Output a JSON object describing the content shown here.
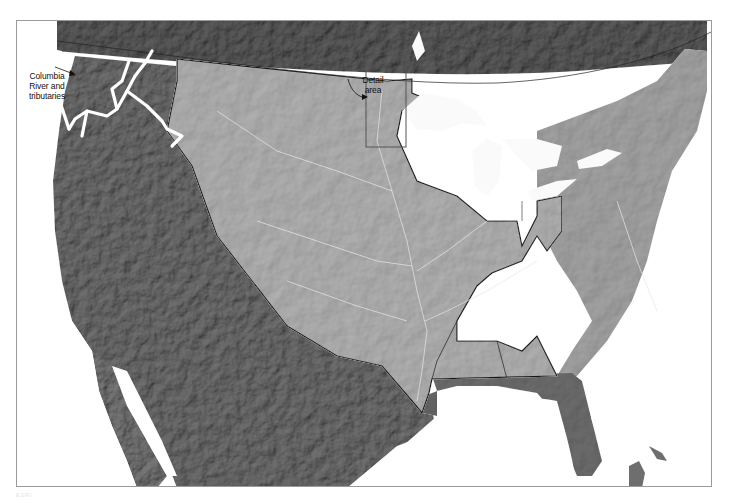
{
  "map": {
    "title": "Mississippi River basin shaded relief",
    "style": "grayscale shaded relief",
    "colors": {
      "background": "#ffffff",
      "water": "#ffffff",
      "basin_fill": "#b4b4b4",
      "outside_basin_fill": "#6e6e6e",
      "canada_fill": "#5e5e5e",
      "basin_outline": "#1a1a1a",
      "columbia_river": "#ffffff",
      "detail_box": "#555555",
      "frame": "#9a9a9a"
    },
    "annotations": {
      "columbia_label": "Columbia River and tributaries",
      "columbia_lines": [
        "Columbia",
        "River and",
        "tributaries"
      ],
      "detail_label": "Detail area",
      "detail_lines": [
        "Detail",
        "area"
      ]
    },
    "features": [
      "Mississippi River drainage basin (outlined, lighter shading)",
      "Columbia River and tributaries (highlighted white)",
      "Detail area rectangle (upper Mississippi, Minnesota)",
      "Great Lakes",
      "Gulf of Mexico",
      "Florida peninsula",
      "Baja California",
      "US–Canada border"
    ],
    "watermark": "ESRI"
  }
}
